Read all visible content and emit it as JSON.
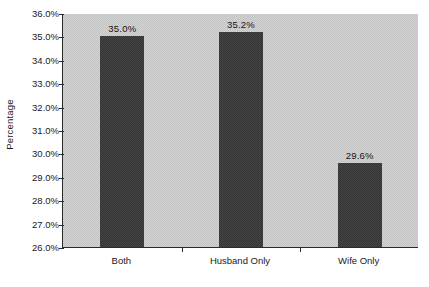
{
  "chart_data": {
    "type": "bar",
    "title": "",
    "subtitle": "",
    "xlabel": "",
    "ylabel": "Percentage",
    "categories": [
      "Both",
      "Husband Only",
      "Wife Only"
    ],
    "values": [
      35.0,
      35.2,
      29.6
    ],
    "value_labels": [
      "35.0%",
      "35.2%",
      "29.6%"
    ],
    "ylim": [
      26.0,
      36.0
    ],
    "ytick_values": [
      36.0,
      35.0,
      34.0,
      33.0,
      32.0,
      31.0,
      30.0,
      29.0,
      28.0,
      27.0,
      26.0
    ],
    "ytick_labels": [
      "36.0%",
      "35.0%",
      "34.0%",
      "33.0%",
      "32.0%",
      "31.0%",
      "30.0%",
      "29.0%",
      "28.0%",
      "27.0%",
      "26.0%"
    ],
    "grid": false,
    "legend": null,
    "legend_position": "none",
    "series": [
      {
        "name": "Percentage",
        "values": [
          35.0,
          35.2,
          29.6
        ]
      }
    ],
    "colors": {
      "bar_fill": "#3b3b3b",
      "plot_background": "#cccccc",
      "axis_line": "#2b2b2b",
      "text": "#1a1a1a",
      "figure_background": "#ffffff"
    }
  }
}
